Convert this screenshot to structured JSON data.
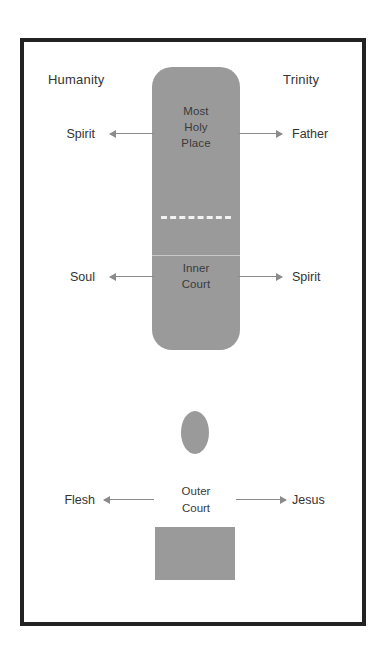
{
  "diagram": {
    "colors": {
      "shape_fill": "#9a9a9a",
      "frame": "#222222",
      "arrow": "#8a8a8a",
      "text": "#333333",
      "veil": "#f2f2f2",
      "background": "#ffffff"
    },
    "headings": {
      "left": "Humanity",
      "right": "Trinity"
    },
    "temple": {
      "most_holy_place": {
        "line1": "Most",
        "line2": "Holy",
        "line3": "Place"
      },
      "inner_court": {
        "line1": "Inner",
        "line2": "Court"
      },
      "veil_style": "dashed"
    },
    "outer_court": {
      "line1": "Outer",
      "line2": "Court"
    },
    "rows": [
      {
        "id": "most-holy-place",
        "left_label": "Spirit",
        "right_label": "Father",
        "left_arrow": "arrow-left-icon",
        "right_arrow": "arrow-right-icon"
      },
      {
        "id": "inner-court",
        "left_label": "Soul",
        "right_label": "Spirit",
        "left_arrow": "arrow-left-icon",
        "right_arrow": "arrow-right-icon"
      },
      {
        "id": "outer-court",
        "left_label": "Flesh",
        "right_label": "Jesus",
        "left_arrow": "arrow-left-icon",
        "right_arrow": "arrow-right-icon"
      }
    ],
    "shapes": [
      {
        "id": "altar-oval",
        "name": "altar-oval-shape"
      },
      {
        "id": "base-rect",
        "name": "base-rectangle-shape"
      }
    ]
  }
}
